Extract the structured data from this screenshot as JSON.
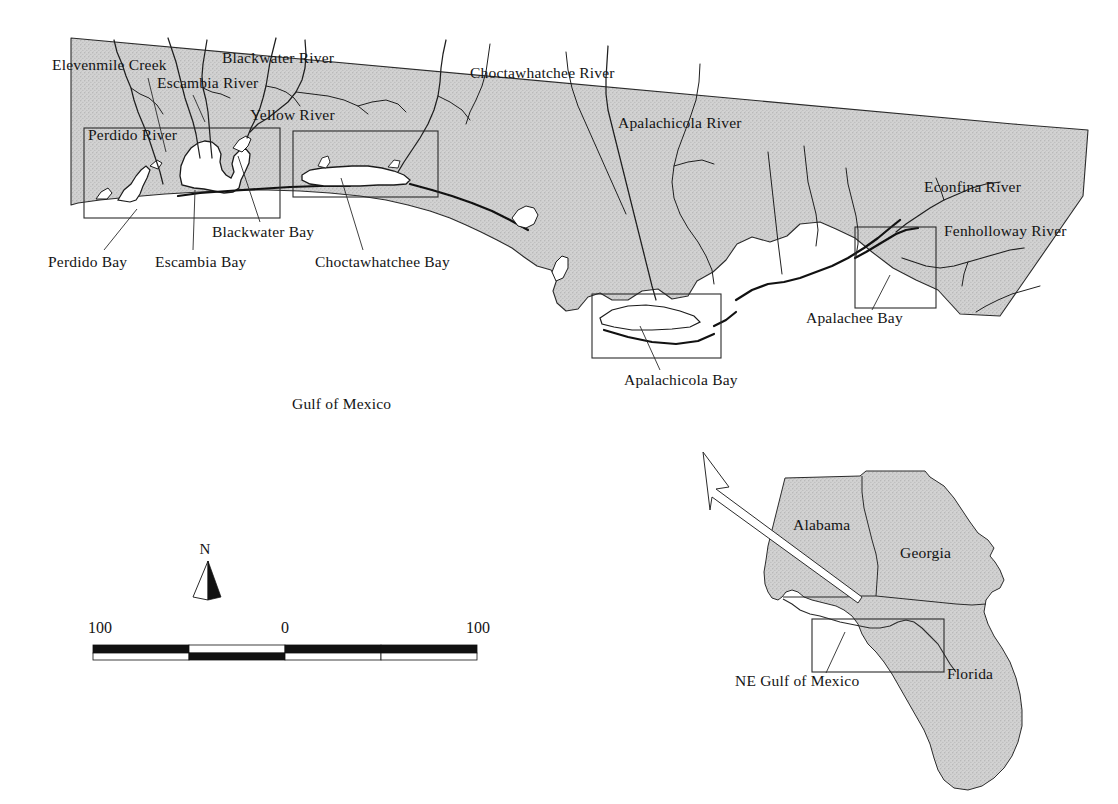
{
  "figure": {
    "water_label": "Gulf of Mexico",
    "land_fill_color": "#cfcfcf",
    "outline_color": "#2b2b2b",
    "background_color": "#ffffff"
  },
  "main_map": {
    "river_labels": [
      {
        "id": "elevenmile-creek",
        "text": "Elevenmile Creek",
        "x": 52,
        "y": 70
      },
      {
        "id": "blackwater-river",
        "text": "Blackwater River",
        "x": 222,
        "y": 63
      },
      {
        "id": "escambia-river",
        "text": "Escambia River",
        "x": 157,
        "y": 88
      },
      {
        "id": "yellow-river",
        "text": "Yellow River",
        "x": 250,
        "y": 120
      },
      {
        "id": "perdido-river",
        "text": "Perdido River",
        "x": 88,
        "y": 140
      },
      {
        "id": "choctawhatchee-river",
        "text": "Choctawhatchee River",
        "x": 470,
        "y": 78
      },
      {
        "id": "apalachicola-river",
        "text": "Apalachicola River",
        "x": 618,
        "y": 128
      },
      {
        "id": "econfina-river",
        "text": "Econfina River",
        "x": 924,
        "y": 192
      },
      {
        "id": "fenholloway-river",
        "text": "Fenholloway River",
        "x": 944,
        "y": 236
      }
    ],
    "bay_labels": [
      {
        "id": "perdido-bay",
        "text": "Perdido Bay",
        "x": 48,
        "y": 267
      },
      {
        "id": "escambia-bay",
        "text": "Escambia Bay",
        "x": 155,
        "y": 267
      },
      {
        "id": "blackwater-bay",
        "text": "Blackwater Bay",
        "x": 212,
        "y": 237
      },
      {
        "id": "choctawhatchee-bay",
        "text": "Choctawhatchee Bay",
        "x": 315,
        "y": 267
      },
      {
        "id": "apalachicola-bay",
        "text": "Apalachicola Bay",
        "x": 624,
        "y": 385
      },
      {
        "id": "apalachee-bay",
        "text": "Apalachee Bay",
        "x": 806,
        "y": 323
      }
    ],
    "water_body": {
      "text": "Gulf of Mexico",
      "x": 292,
      "y": 409
    },
    "detail_boxes": [
      {
        "id": "box-pensacola",
        "x": 84,
        "y": 128,
        "width": 196,
        "height": 90
      },
      {
        "id": "box-choctawhatchee",
        "x": 293,
        "y": 131,
        "width": 145,
        "height": 66
      },
      {
        "id": "box-apalachicola",
        "x": 592,
        "y": 294,
        "width": 129,
        "height": 64
      },
      {
        "id": "box-apalachee",
        "x": 855,
        "y": 227,
        "width": 81,
        "height": 81
      }
    ]
  },
  "scale_bar": {
    "name": "scale-bar",
    "unit": "km",
    "ticks": [
      "100",
      "0",
      "100"
    ],
    "left_label": "100",
    "center_label": "0",
    "right_label": "100",
    "unit_label": "km",
    "segments": 4,
    "total_km": 200
  },
  "north_arrow": {
    "name": "north-arrow",
    "label": "N"
  },
  "inset_map": {
    "name": "locator-inset",
    "state_labels": [
      {
        "id": "alabama",
        "text": "Alabama",
        "x": 793,
        "y": 530
      },
      {
        "id": "georgia",
        "text": "Georgia",
        "x": 900,
        "y": 558
      },
      {
        "id": "florida",
        "text": "Florida",
        "x": 947,
        "y": 679
      }
    ],
    "callout_label": {
      "text": "NE Gulf of Mexico",
      "x": 735,
      "y": 686
    },
    "extent_box": {
      "x": 812,
      "y": 619,
      "width": 132,
      "height": 53
    }
  }
}
